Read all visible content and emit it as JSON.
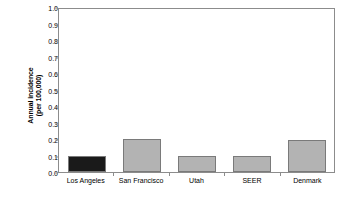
{
  "chart_data": {
    "type": "bar",
    "title": "",
    "subtitle": "",
    "xlabel": "",
    "ylabel_line1": "Annual incidence",
    "ylabel_line2": "(per 100,000)",
    "categories": [
      "Los Angeles",
      "San Francisco",
      "Utah",
      "SEER",
      "Denmark"
    ],
    "values": [
      0.1,
      0.2,
      0.1,
      0.1,
      0.195
    ],
    "bar_colors": [
      "#1a1a1a",
      "#b3b3b3",
      "#b3b3b3",
      "#b3b3b3",
      "#b3b3b3"
    ],
    "bar_border_color": "#7a7a7a",
    "ylim": [
      0.0,
      1.0
    ],
    "ytick_values": [
      0.0,
      0.1,
      0.2,
      0.3,
      0.4,
      0.5,
      0.6,
      0.7,
      0.8,
      0.9,
      1.0
    ],
    "ytick_labels": [
      "0.0",
      "0.1",
      "0.2",
      "0.3",
      "0.4",
      "0.5",
      "0.6",
      "0.7",
      "0.8",
      "0.9",
      "1.0"
    ],
    "grid": false,
    "legend": null,
    "legend_position": "none",
    "frame_color": "#8c8c8c",
    "background_color": "#ffffff"
  }
}
